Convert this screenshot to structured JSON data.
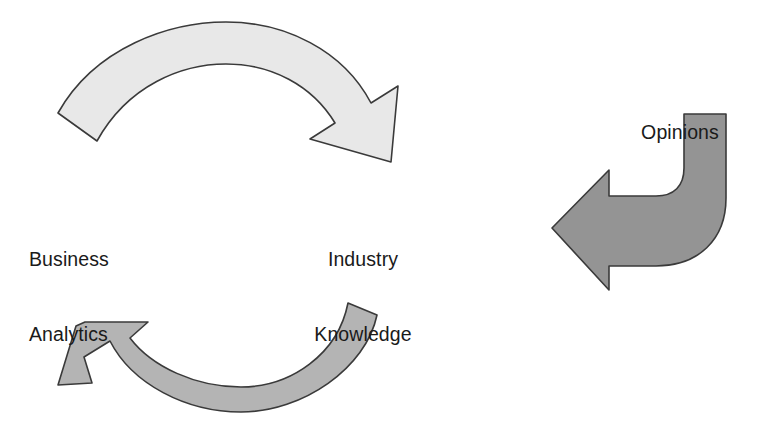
{
  "diagram": {
    "type": "cycle-diagram",
    "background_color": "#ffffff",
    "stroke_color": "#3a3a3a",
    "text_color": "#1a1a1a",
    "labels": {
      "business_analytics": {
        "line1": "Business",
        "line2": "Analytics"
      },
      "industry_knowledge": {
        "line1": "Industry",
        "line2": "Knowledge"
      },
      "opinions": {
        "line1": "Opinions"
      }
    },
    "arrows": [
      {
        "name": "top-arc-arrow",
        "direction": "clockwise-right",
        "fill_color": "#e8e8e8",
        "description": "Upper curved arrow sweeping from lower-left up and over to the right, arrowhead pointing down-right toward Industry Knowledge"
      },
      {
        "name": "bottom-arc-arrow",
        "direction": "clockwise-left",
        "fill_color": "#b4b4b4",
        "description": "Lower curved arrow sweeping from the right down and around to the left, arrowhead pointing up-left toward Business Analytics"
      },
      {
        "name": "opinions-elbow-arrow",
        "direction": "down-then-left",
        "fill_color": "#949494",
        "description": "Bent elbow arrow descending from the Opinions label then turning left with a large arrowhead pointing into the cycle"
      }
    ]
  }
}
